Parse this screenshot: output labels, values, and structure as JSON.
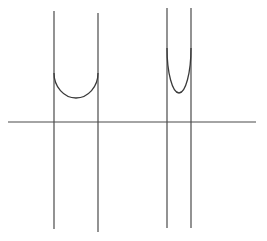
{
  "diagram": {
    "colors": {
      "background": "#ffffff",
      "stroke": "#4a4a4a"
    },
    "axis": {
      "x1": 8,
      "x2": 256,
      "y": 122
    },
    "asymptotes": [
      {
        "x": 54,
        "y1": 11,
        "y2": 229
      },
      {
        "x": 98,
        "y1": 13,
        "y2": 232
      },
      {
        "x": 167,
        "y1": 8,
        "y2": 228
      },
      {
        "x": 191,
        "y1": 8,
        "y2": 228
      }
    ],
    "curves": [
      {
        "name": "wide-u-curve",
        "left_x": 54,
        "right_x": 98,
        "top_y": 73,
        "bottom_x": 76,
        "bottom_y": 98
      },
      {
        "name": "narrow-u-curve",
        "left_x": 167,
        "right_x": 191,
        "top_y": 48,
        "bottom_x": 179,
        "bottom_y": 93
      }
    ]
  }
}
